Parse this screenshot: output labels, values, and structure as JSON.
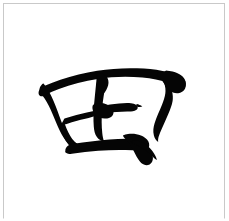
{
  "card": {
    "name": "calligraphy-specimen-card",
    "background_color": "#ffffff",
    "border_color": "#c9c9c9",
    "width_px": 229,
    "height_px": 221
  },
  "glyph": {
    "character": "田",
    "meaning": "rice field",
    "script_style": "semi-cursive brush calligraphy",
    "ink_color": "#050505",
    "stroke_count": 5,
    "bounding_box": {
      "x": 38,
      "y": 68,
      "width": 148,
      "height": 92
    },
    "strokes": [
      {
        "name": "left-vertical-sweep",
        "order": 1,
        "description": "downward left side stroke curving right at the foot"
      },
      {
        "name": "top-horizontal-with-right-hook",
        "order": 2,
        "description": "rising top bar turning into a heavy right shoulder"
      },
      {
        "name": "inner-vertical",
        "order": 3,
        "description": "central vertical dividing the enclosure"
      },
      {
        "name": "inner-horizontal",
        "order": 4,
        "description": "central crossbar through the enclosure"
      },
      {
        "name": "bottom-horizontal-closing",
        "order": 5,
        "description": "base stroke sweeping to a pointed lower-right tail"
      }
    ]
  },
  "caption": {
    "label": "田"
  }
}
